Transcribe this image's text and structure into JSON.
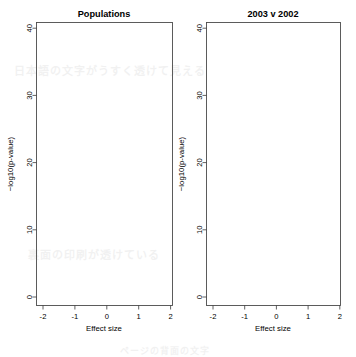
{
  "figure": {
    "kind": "volcano-plot-pair",
    "background_color": "#ffffff",
    "point_color": "#000000",
    "frame_color": "#4a4a4a"
  },
  "background_bleed_text": [
    "日本語の文字がうすく透けて見える",
    "裏面の印刷が透けている",
    "ページの背面の文字"
  ],
  "panels": [
    {
      "id": "left",
      "title": "Populations",
      "xlabel": "Effect size",
      "ylabel": "−log10(p-value)",
      "xticks": [
        -2,
        -1,
        0,
        1,
        2
      ],
      "xticklabels": [
        "-2",
        "-1",
        "0",
        "1",
        "2"
      ],
      "yticks": [
        0,
        10,
        20,
        30,
        40
      ],
      "yticklabels": [
        "0",
        "10",
        "20",
        "30",
        "40"
      ],
      "xlim": [
        -2.28,
        2.28
      ],
      "ylim": [
        -1.2,
        41.5
      ]
    },
    {
      "id": "right",
      "title": "2003 v 2002",
      "xlabel": "Effect size",
      "ylabel": "−log10(p-value)",
      "xticks": [
        -2,
        -1,
        0,
        1,
        2
      ],
      "xticklabels": [
        "-2",
        "-1",
        "0",
        "1",
        "2"
      ],
      "yticks": [
        0,
        10,
        20,
        30,
        40
      ],
      "yticklabels": [
        "0",
        "10",
        "20",
        "30",
        "40"
      ],
      "xlim": [
        -2.28,
        2.28
      ],
      "ylim": [
        -1.2,
        41.5
      ]
    }
  ],
  "chart_data": [
    {
      "type": "scatter",
      "panel": "left",
      "title": "Populations",
      "xlabel": "Effect size",
      "ylabel": "−log10(p-value)",
      "xlim": [
        -2.28,
        2.28
      ],
      "ylim": [
        -1.2,
        41.5
      ],
      "xticks": [
        -2,
        -1,
        0,
        1,
        2
      ],
      "yticks": [
        0,
        10,
        20,
        30,
        40
      ],
      "grid": false,
      "legend": null,
      "marker": "open-circle",
      "n_points_approx": 2600,
      "description": "Dense V-shaped volcano cloud, two arms diverging from (0,0); left arm extends to effect size about -1.5, right arm to about +1.6; peak significance near 40; scattered high outliers above 22.",
      "distribution": {
        "generator": "volcano",
        "n": 2600,
        "arm_slope": 23.0,
        "y_max": 40.5,
        "y_decay": 5.2,
        "spread": 0.105,
        "outlier_count": 150,
        "outlier_y_min": 9.0,
        "outlier_y_max": 33.0,
        "seed": 1887
      },
      "notable_points": [
        {
          "x": -1.33,
          "y": 39.6,
          "note": "highest point, left arm"
        },
        {
          "x": -2.02,
          "y": 23.8,
          "note": "isolated far-left outlier"
        },
        {
          "x": 1.78,
          "y": 29.9,
          "note": "isolated far-right outlier"
        },
        {
          "x": -0.82,
          "y": 35.2
        },
        {
          "x": -0.72,
          "y": 34.4
        },
        {
          "x": 0.62,
          "y": 32.6
        },
        {
          "x": 0.66,
          "y": 31.4
        },
        {
          "x": -0.93,
          "y": 31.8
        },
        {
          "x": -0.88,
          "y": 31.6
        },
        {
          "x": 0.6,
          "y": 30.1
        },
        {
          "x": 0.58,
          "y": 29.9
        },
        {
          "x": -0.97,
          "y": 29.1
        },
        {
          "x": -0.79,
          "y": 28.9
        },
        {
          "x": -1.36,
          "y": 26.2
        },
        {
          "x": -1.33,
          "y": 26.1
        },
        {
          "x": 1.3,
          "y": 24.7
        }
      ]
    },
    {
      "type": "scatter",
      "panel": "right",
      "title": "2003 v 2002",
      "xlabel": "Effect size",
      "ylabel": "−log10(p-value)",
      "xlim": [
        -2.28,
        2.28
      ],
      "ylim": [
        -1.2,
        41.5
      ],
      "xticks": [
        -2,
        -1,
        0,
        1,
        2
      ],
      "yticks": [
        0,
        10,
        20,
        30,
        40
      ],
      "grid": false,
      "legend": null,
      "marker": "open-circle",
      "n_points_approx": 1500,
      "description": "Smaller, narrower V-shaped volcano cloud confined below about 15 on the y axis; arms reach effect size about -0.9 and +1.2; right arm slightly longer and denser.",
      "distribution": {
        "generator": "volcano",
        "n": 1500,
        "arm_slope": 20.0,
        "y_max": 14.8,
        "y_decay": 3.1,
        "spread": 0.085,
        "outlier_count": 70,
        "outlier_y_min": 5.0,
        "outlier_y_max": 13.0,
        "seed": 4421
      },
      "notable_points": [
        {
          "x": 1.12,
          "y": 14.6,
          "note": "highest point, right arm"
        },
        {
          "x": 1.02,
          "y": 13.1
        },
        {
          "x": 1.18,
          "y": 12.4
        },
        {
          "x": 0.86,
          "y": 12.8
        },
        {
          "x": 0.72,
          "y": 12.1
        },
        {
          "x": -0.55,
          "y": 11.4
        },
        {
          "x": -0.49,
          "y": 11.1
        },
        {
          "x": -0.74,
          "y": 7.6
        },
        {
          "x": 1.1,
          "y": 10.6
        },
        {
          "x": 0.95,
          "y": 10.2
        }
      ]
    }
  ]
}
